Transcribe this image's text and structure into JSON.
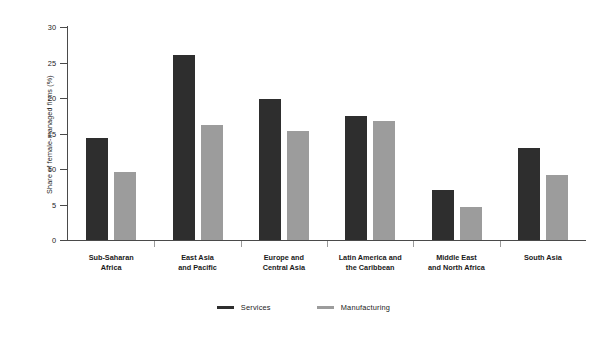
{
  "chart_data": {
    "type": "bar",
    "title": "",
    "subtitle": "",
    "xlabel": "",
    "ylabel": "Share of female-managed firms (%)",
    "ylim": [
      0,
      30
    ],
    "yticks": [
      0,
      5,
      10,
      15,
      20,
      25,
      30
    ],
    "ytick_labels": [
      "0",
      "5",
      "10",
      "15",
      "20",
      "25",
      "30"
    ],
    "grid": false,
    "legend_position": "bottom",
    "categories": [
      "Sub-Saharan Africa",
      "East Asia and Pacific",
      "Europe and Central Asia",
      "Latin America and the Caribbean",
      "Middle East and North Africa",
      "South Asia"
    ],
    "category_lines": [
      [
        "Sub-Saharan",
        "Africa"
      ],
      [
        "East Asia",
        "and Pacific"
      ],
      [
        "Europe and",
        "Central Asia"
      ],
      [
        "Latin America and",
        "the Caribbean"
      ],
      [
        "Middle East",
        "and North Africa"
      ],
      [
        "South Asia"
      ]
    ],
    "series": [
      {
        "name": "Services",
        "color": "#2e2e2e",
        "values": [
          14.3,
          26.1,
          19.9,
          17.5,
          7.0,
          12.9
        ]
      },
      {
        "name": "Manufacturing",
        "color": "#9c9c9c",
        "values": [
          9.6,
          16.2,
          15.4,
          16.8,
          4.7,
          9.1
        ]
      }
    ]
  },
  "legend": {
    "items": [
      {
        "label": "Services",
        "color": "#2e2e2e"
      },
      {
        "label": "Manufacturing",
        "color": "#9c9c9c"
      }
    ]
  },
  "colors": {
    "services": "#2e2e2e",
    "manufacturing": "#9c9c9c",
    "axis": "#4a4a4a",
    "background": "#ffffff"
  }
}
